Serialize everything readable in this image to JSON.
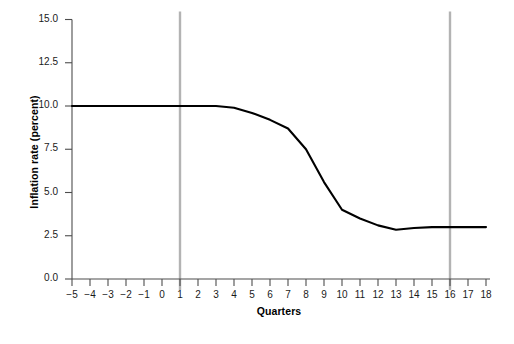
{
  "chart_data": {
    "type": "line",
    "title": "",
    "xlabel": "Quarters",
    "ylabel": "Inflation rate (percent)",
    "x": [
      -5,
      -4,
      -3,
      -2,
      -1,
      0,
      1,
      2,
      3,
      4,
      5,
      6,
      7,
      8,
      9,
      10,
      11,
      12,
      13,
      14,
      15,
      16,
      17,
      18
    ],
    "values": [
      10.0,
      10.0,
      10.0,
      10.0,
      10.0,
      10.0,
      10.0,
      10.0,
      10.0,
      9.9,
      9.6,
      9.2,
      8.7,
      7.5,
      5.6,
      4.0,
      3.5,
      3.1,
      2.85,
      2.95,
      3.0,
      3.0,
      3.0,
      3.0
    ],
    "series": [
      {
        "name": "Inflation rate",
        "color": "#000000",
        "values": [
          10.0,
          10.0,
          10.0,
          10.0,
          10.0,
          10.0,
          10.0,
          10.0,
          10.0,
          9.9,
          9.6,
          9.2,
          8.7,
          7.5,
          5.6,
          4.0,
          3.5,
          3.1,
          2.85,
          2.95,
          3.0,
          3.0,
          3.0,
          3.0
        ]
      }
    ],
    "xlim": [
      -5,
      18
    ],
    "ylim": [
      0.0,
      15.0
    ],
    "xticks": [
      "−5",
      "−4",
      "−3",
      "−2",
      "−1",
      "0",
      "1",
      "2",
      "3",
      "4",
      "5",
      "6",
      "7",
      "8",
      "9",
      "10",
      "11",
      "12",
      "13",
      "14",
      "15",
      "16",
      "17",
      "18"
    ],
    "xtick_values": [
      -5,
      -4,
      -3,
      -2,
      -1,
      0,
      1,
      2,
      3,
      4,
      5,
      6,
      7,
      8,
      9,
      10,
      11,
      12,
      13,
      14,
      15,
      16,
      17,
      18
    ],
    "yticks": [
      "0.0",
      "2.5",
      "5.0",
      "7.5",
      "10.0",
      "12.5",
      "15.0"
    ],
    "ytick_values": [
      0.0,
      2.5,
      5.0,
      7.5,
      10.0,
      12.5,
      15.0
    ],
    "grid": false,
    "legend": "none",
    "annotations": [
      {
        "name": "vertical-marker-quarter-1",
        "type": "vline",
        "x": 1,
        "color": "#b3b3b3"
      },
      {
        "name": "vertical-marker-quarter-16",
        "type": "vline",
        "x": 16,
        "color": "#b3b3b3"
      }
    ],
    "colors": {
      "line": "#000000",
      "axis": "#4d4d4d",
      "marker": "#b3b3b3",
      "background": "#ffffff"
    }
  }
}
